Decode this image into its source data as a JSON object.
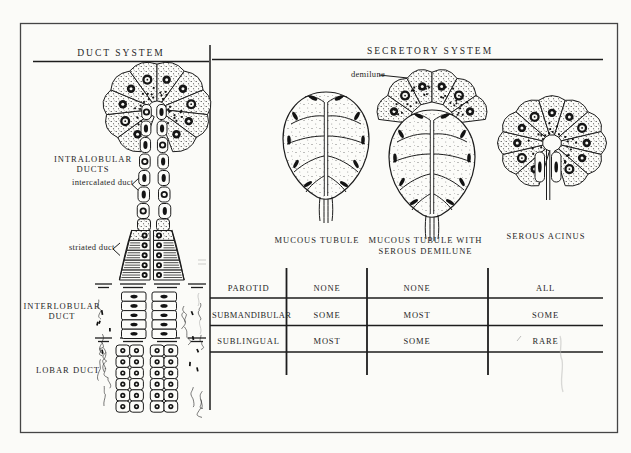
{
  "figure": {
    "headers": {
      "left": "DUCT SYSTEM",
      "right": "SECRETORY SYSTEM"
    },
    "duct_system": {
      "labels": {
        "intralobular": [
          "INTRALOBULAR",
          "DUCTS"
        ],
        "intercalated": "intercalated duct",
        "striated": "striated duct",
        "interlobular": [
          "INTERLOBULAR",
          "DUCT"
        ],
        "lobar": "LOBAR DUCT"
      }
    },
    "secretory_system": {
      "annotation": "demilune",
      "captions": {
        "mucous": "MUCOUS TUBULE",
        "mucous_demilune": [
          "MUCOUS TUBULE WITH",
          "SEROUS DEMILUNE"
        ],
        "serous": "SEROUS ACINUS"
      }
    },
    "table": {
      "rows": [
        {
          "label": "PAROTID",
          "cells": [
            "NONE",
            "NONE",
            "ALL"
          ]
        },
        {
          "label": "SUBMANDIBULAR",
          "cells": [
            "SOME",
            "MOST",
            "SOME"
          ]
        },
        {
          "label": "SUBLINGUAL",
          "cells": [
            "MOST",
            "SOME",
            "RARE"
          ]
        }
      ]
    },
    "colors": {
      "ink": "#1d1d1d",
      "paper": "#fbfbf8"
    }
  }
}
